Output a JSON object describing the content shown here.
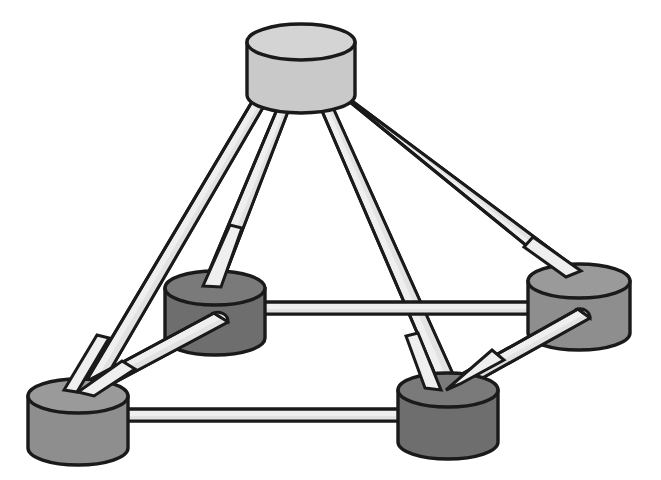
{
  "figure": {
    "background_color": "#ffffff",
    "outline_color": "#1a1a1a",
    "width": 661,
    "height": 480
  },
  "palette": {
    "rod_face": "#efefef",
    "rod_shade": "#e2e2e2",
    "node_light_top": "#d4d4d4",
    "node_light_side": "#c9c9c9",
    "node_mid_top": "#9a9a9a",
    "node_mid_side": "#8e8e8e",
    "node_dark_top": "#7a7a7a",
    "node_dark_side": "#6e6e6e",
    "outline": "#1a1a1a"
  },
  "nodes": [
    {
      "id": "apex",
      "label": "apex-node",
      "shade": "light",
      "cx": 301,
      "cy": 42,
      "rx": 54,
      "ry": 18,
      "height": 53
    },
    {
      "id": "mid-left",
      "label": "mid-left-node",
      "shade": "dark",
      "cx": 215,
      "cy": 288,
      "rx": 50,
      "ry": 17,
      "height": 50
    },
    {
      "id": "mid-right",
      "label": "mid-right-node",
      "shade": "mid",
      "cx": 579,
      "cy": 281,
      "rx": 51,
      "ry": 17,
      "height": 52
    },
    {
      "id": "front-left",
      "label": "front-left-node",
      "shade": "mid",
      "cx": 78,
      "cy": 396,
      "rx": 50,
      "ry": 17,
      "height": 52
    },
    {
      "id": "front-right",
      "label": "front-right-node",
      "shade": "dark",
      "cx": 448,
      "cy": 390,
      "rx": 50,
      "ry": 17,
      "height": 52
    }
  ],
  "rods": [
    {
      "id": "apex-front-left",
      "from": "apex",
      "to": "front-left",
      "thickness": 11
    },
    {
      "id": "apex-mid-left",
      "from": "apex",
      "to": "mid-left",
      "thickness": 11
    },
    {
      "id": "apex-front-right",
      "from": "apex",
      "to": "front-right",
      "thickness": 11
    },
    {
      "id": "apex-mid-right",
      "from": "apex",
      "to": "mid-right",
      "thickness": 11
    },
    {
      "id": "mid-left-front-left",
      "from": "mid-left",
      "to": "front-left",
      "thickness": 11
    },
    {
      "id": "mid-right-front-right",
      "from": "mid-right",
      "to": "front-right",
      "thickness": 11
    },
    {
      "id": "mid-left-mid-right",
      "from": "mid-left",
      "to": "mid-right",
      "thickness": 11
    },
    {
      "id": "front-left-front-right",
      "from": "front-left",
      "to": "front-right",
      "thickness": 11
    }
  ],
  "counts": {
    "node_count": 5,
    "rod_count": 8
  }
}
